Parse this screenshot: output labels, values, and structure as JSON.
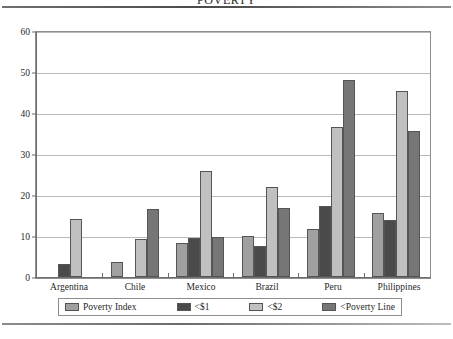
{
  "document": {
    "title": "POVERTY"
  },
  "chart_data": {
    "type": "bar",
    "title": "POVERTY",
    "xlabel": "",
    "ylabel": "",
    "ylim": [
      0,
      60
    ],
    "yticks": [
      0,
      10,
      20,
      30,
      40,
      50,
      60
    ],
    "grid": true,
    "legend_position": "bottom",
    "categories": [
      "Argentina",
      "Chile",
      "Mexico",
      "Brazil",
      "Peru",
      "Philippines"
    ],
    "series": [
      {
        "name": "Poverty Index",
        "color": "#a0a0a0",
        "values": [
          null,
          3.8,
          8.4,
          10.0,
          11.8,
          15.8
        ]
      },
      {
        "name": "<$1",
        "color": "#4a4a4a",
        "values": [
          3.3,
          null,
          9.6,
          7.6,
          17.5,
          14.0
        ]
      },
      {
        "name": "<$2",
        "color": "#c0c0c0",
        "values": [
          14.3,
          9.4,
          26.0,
          22.2,
          37.0,
          45.7
        ]
      },
      {
        "name": "<Poverty Line",
        "color": "#767676",
        "values": [
          null,
          16.8,
          9.8,
          17.0,
          48.5,
          36.0
        ]
      }
    ]
  },
  "axis": {
    "tick_labels": [
      "60",
      "50",
      "40",
      "30",
      "20",
      "10",
      "0"
    ]
  },
  "legend": {
    "items": [
      {
        "label": "Poverty Index",
        "color": "#a0a0a0"
      },
      {
        "label": "<$1",
        "color": "#4a4a4a"
      },
      {
        "label": "<$2",
        "color": "#c0c0c0"
      },
      {
        "label": "<Poverty Line",
        "color": "#767676"
      }
    ]
  }
}
